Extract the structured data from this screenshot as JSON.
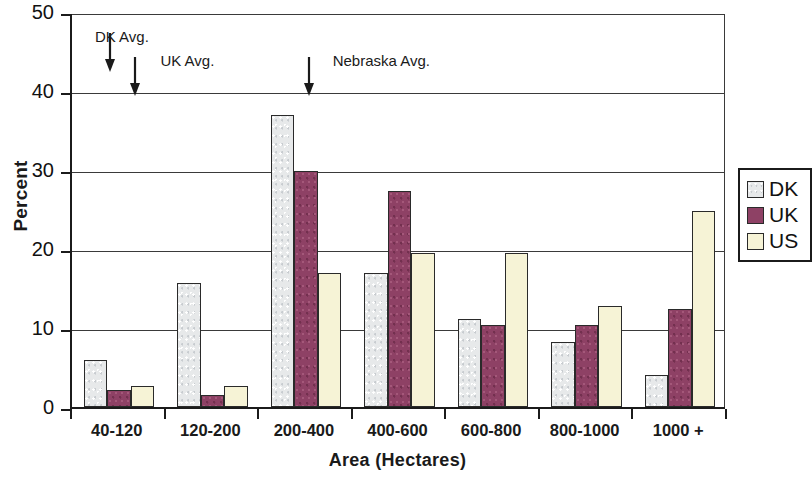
{
  "chart_data": {
    "type": "bar",
    "title": "",
    "xlabel": "Area (Hectares)",
    "ylabel": "Percent",
    "ylim": [
      0,
      50
    ],
    "yticks": [
      0,
      10,
      20,
      30,
      40,
      50
    ],
    "ytick_labels": [
      "0",
      "10",
      "20",
      "30",
      "40",
      "50"
    ],
    "grid": "horizontal",
    "legend_position": "right",
    "categories": [
      "40-120",
      "120-200",
      "200-400",
      "400-600",
      "600-800",
      "800-1000",
      "1000 +"
    ],
    "series": [
      {
        "name": "DK",
        "color": "#e7e9ea",
        "values": [
          5.9,
          15.7,
          37.0,
          17.0,
          11.2,
          8.2,
          4.0
        ]
      },
      {
        "name": "UK",
        "color": "#8e4165",
        "values": [
          2.2,
          1.5,
          29.9,
          27.3,
          10.4,
          10.4,
          12.4
        ]
      },
      {
        "name": "US",
        "color": "#f6f3d6",
        "values": [
          2.6,
          2.6,
          17.0,
          19.5,
          19.5,
          12.8,
          24.8
        ]
      }
    ],
    "annotations": [
      {
        "label": "DK Avg.",
        "arrow_x_frac": 0.058,
        "label_x_frac": 0.035,
        "label_y_pct": 48.2
      },
      {
        "label": "UK Avg.",
        "arrow_x_frac": 0.096,
        "label_x_frac": 0.135,
        "label_y_pct": 45.2
      },
      {
        "label": "Nebraska Avg.",
        "arrow_x_frac": 0.362,
        "label_x_frac": 0.398,
        "label_y_pct": 45.2
      }
    ]
  },
  "legend": {
    "items": [
      {
        "label": "DK"
      },
      {
        "label": "UK"
      },
      {
        "label": "US"
      }
    ]
  }
}
